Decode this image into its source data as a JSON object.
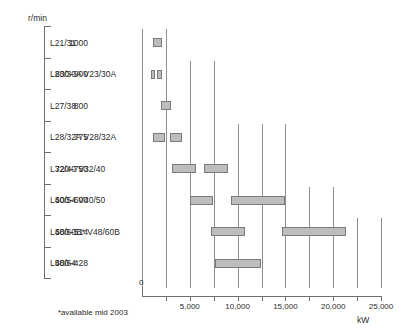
{
  "axis_titles": {
    "y_unit": "r/min",
    "x_unit": "kW"
  },
  "footnote": "*available mid 2003",
  "zero_label": "0",
  "chart_data": {
    "type": "bar",
    "orientation": "horizontal-range",
    "title": "",
    "xlabel": "kW",
    "ylabel": "r/min",
    "xlim": [
      0,
      25000
    ],
    "xticks": [
      0,
      2500,
      5000,
      7500,
      10000,
      12500,
      15000,
      17500,
      20000,
      22500,
      25000
    ],
    "xtick_labels": [
      "0",
      "",
      "5,000",
      "",
      "10,000",
      "",
      "15,000",
      "",
      "20,000",
      "",
      "25,000"
    ],
    "grid": true,
    "legend": null,
    "categories": [
      {
        "speed": "1000",
        "engine": "L21/31"
      },
      {
        "speed": "800–900",
        "engine": "L23/30A V23/30A"
      },
      {
        "speed": "800",
        "engine": "L27/38"
      },
      {
        "speed": "775",
        "engine": "L28/32A V28/32A"
      },
      {
        "speed": "720–750",
        "engine": "L32/40 V32/40"
      },
      {
        "speed": "500–600",
        "engine": "L40/54 V40/50"
      },
      {
        "speed": "500–514",
        "engine": "L48/60B* V48/60B"
      },
      {
        "speed": "400–428",
        "engine": "L58/64"
      }
    ],
    "bars": [
      {
        "row": 0,
        "segments": [
          [
            1150,
            2100
          ]
        ]
      },
      {
        "row": 1,
        "segments": [
          [
            900,
            1350
          ],
          [
            1600,
            2050
          ]
        ]
      },
      {
        "row": 2,
        "segments": [
          [
            1950,
            3000
          ]
        ]
      },
      {
        "row": 3,
        "segments": [
          [
            1150,
            2400
          ],
          [
            2950,
            4200
          ]
        ]
      },
      {
        "row": 4,
        "segments": [
          [
            3100,
            5600
          ],
          [
            6450,
            9000
          ]
        ]
      },
      {
        "row": 5,
        "segments": [
          [
            5000,
            7400
          ],
          [
            9300,
            15000
          ]
        ]
      },
      {
        "row": 6,
        "segments": [
          [
            7200,
            10800
          ],
          [
            14600,
            21300
          ]
        ]
      },
      {
        "row": 7,
        "segments": [
          [
            7600,
            12500
          ]
        ]
      }
    ],
    "gridlines_kw": [
      {
        "kw": 0,
        "top_row": 0
      },
      {
        "kw": 2500,
        "top_row": 0
      },
      {
        "kw": 5000,
        "top_row": 1
      },
      {
        "kw": 7500,
        "top_row": 1
      },
      {
        "kw": 10000,
        "top_row": 3
      },
      {
        "kw": 12500,
        "top_row": 3
      },
      {
        "kw": 15000,
        "top_row": 3
      },
      {
        "kw": 17500,
        "top_row": 5
      },
      {
        "kw": 20000,
        "top_row": 5
      },
      {
        "kw": 22500,
        "top_row": 6
      },
      {
        "kw": 25000,
        "top_row": 6
      }
    ]
  }
}
